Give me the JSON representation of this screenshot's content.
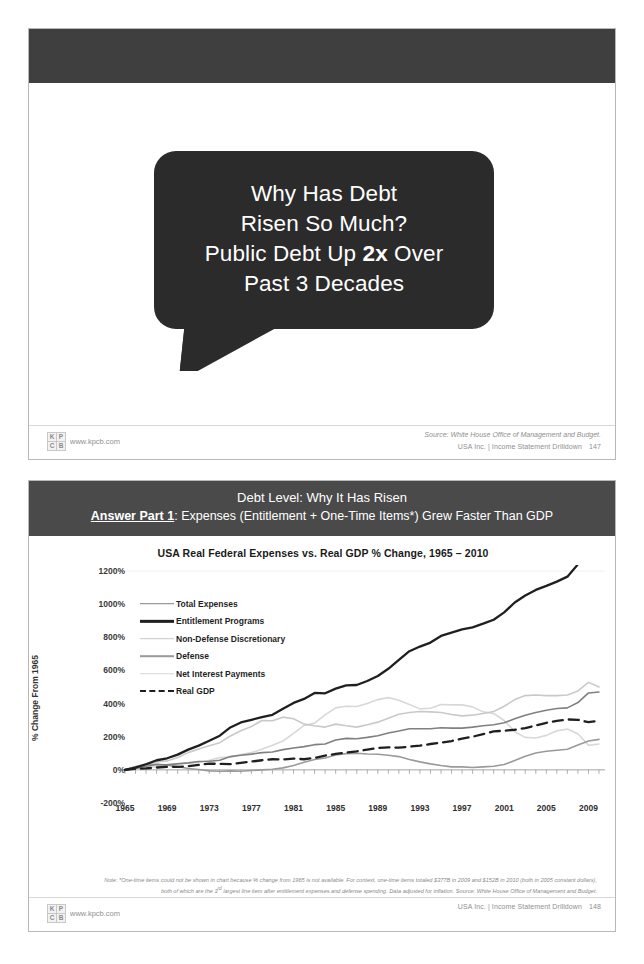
{
  "slide1": {
    "bubble_lines": [
      {
        "text": "Why Has Debt",
        "bold_part": ""
      },
      {
        "text": "Risen So Much?",
        "bold_part": ""
      },
      {
        "text": "Public Debt Up 2x Over",
        "bold_part": "2x"
      },
      {
        "text": "Past 3 Decades",
        "bold_part": ""
      }
    ],
    "footer": {
      "url": "www.kpcb.com",
      "source": "Source: White House Office of Management and Budget.",
      "deck": "USA Inc. | Income Statement Drilldown",
      "page": "147",
      "logo": [
        "K",
        "P",
        "C",
        "B"
      ]
    }
  },
  "slide2": {
    "header_line1": "Debt Level: Why It Has Risen",
    "header_line2_bold": "Answer Part 1",
    "header_line2_rest": ": Expenses (Entitlement + One-Time Items*) Grew Faster Than GDP",
    "footnote": "Note: *One-time items could not be shown in chart because % change from 1965 is not available. For context, one-time items totaled $377B in 2009 and $152B in 2010 (both in 2005 constant dollars), both of which are the 3rd largest line item after entitlement expenses and defense spending. Data adjusted for inflation. Source: White House Office of Management and Budget.",
    "footer": {
      "url": "www.kpcb.com",
      "deck": "USA Inc. | Income Statement Drilldown",
      "page": "148",
      "logo": [
        "K",
        "P",
        "C",
        "B"
      ]
    }
  },
  "chart_data": {
    "type": "line",
    "title": "USA Real Federal Expenses vs. Real GDP % Change, 1965 – 2010",
    "xlabel": "",
    "ylabel": "% Change From 1965",
    "ylim": [
      -200,
      1200
    ],
    "yticks": [
      "1200%",
      "1000%",
      "800%",
      "600%",
      "400%",
      "200%",
      "0%",
      "-200%"
    ],
    "ytick_values": [
      1200,
      1000,
      800,
      600,
      400,
      200,
      0,
      -200
    ],
    "xlim": [
      1965,
      2010
    ],
    "xticks": [
      "1965",
      "1969",
      "1973",
      "1977",
      "1981",
      "1985",
      "1989",
      "1993",
      "1997",
      "2001",
      "2005",
      "2009"
    ],
    "xtick_values": [
      1965,
      1969,
      1973,
      1977,
      1981,
      1985,
      1989,
      1993,
      1997,
      2001,
      2005,
      2009
    ],
    "grid": false,
    "legend_position": "inside-upper-left",
    "x": [
      1965,
      1966,
      1967,
      1968,
      1969,
      1970,
      1971,
      1972,
      1973,
      1974,
      1975,
      1976,
      1977,
      1978,
      1979,
      1980,
      1981,
      1982,
      1983,
      1984,
      1985,
      1986,
      1987,
      1988,
      1989,
      1990,
      1991,
      1992,
      1993,
      1994,
      1995,
      1996,
      1997,
      1998,
      1999,
      2000,
      2001,
      2002,
      2003,
      2004,
      2005,
      2006,
      2007,
      2008,
      2009,
      2010
    ],
    "series": [
      {
        "name": "Total Expenses",
        "color": "#808080",
        "width": 1.6,
        "dash": "none",
        "values": [
          0,
          8,
          22,
          32,
          30,
          36,
          42,
          50,
          52,
          58,
          80,
          88,
          95,
          104,
          108,
          122,
          132,
          140,
          152,
          156,
          180,
          190,
          188,
          196,
          206,
          222,
          234,
          248,
          248,
          248,
          254,
          252,
          252,
          258,
          266,
          272,
          284,
          308,
          330,
          346,
          360,
          370,
          374,
          406,
          464,
          470
        ]
      },
      {
        "name": "Entitlement Programs",
        "color": "#1f1f1f",
        "width": 2.3,
        "dash": "none",
        "values": [
          0,
          14,
          34,
          58,
          70,
          92,
          122,
          146,
          176,
          206,
          256,
          286,
          302,
          318,
          332,
          368,
          404,
          428,
          464,
          462,
          490,
          510,
          512,
          536,
          566,
          610,
          664,
          716,
          744,
          768,
          808,
          828,
          848,
          860,
          882,
          906,
          950,
          1010,
          1052,
          1086,
          1110,
          1136,
          1166,
          1240,
          1372,
          1398
        ]
      },
      {
        "name": "Non-Defense Discretionary",
        "color": "#c9c9c9",
        "width": 1.6,
        "dash": "none",
        "values": [
          0,
          18,
          36,
          48,
          54,
          74,
          104,
          126,
          146,
          164,
          204,
          236,
          262,
          298,
          296,
          318,
          308,
          276,
          266,
          258,
          276,
          266,
          258,
          272,
          288,
          312,
          336,
          346,
          352,
          350,
          346,
          334,
          326,
          330,
          340,
          352,
          384,
          424,
          448,
          452,
          448,
          448,
          452,
          476,
          528,
          500
        ]
      },
      {
        "name": "Defense",
        "color": "#9a9a9a",
        "width": 1.6,
        "dash": "none",
        "values": [
          0,
          20,
          32,
          34,
          28,
          20,
          8,
          2,
          -6,
          -8,
          -6,
          -8,
          -4,
          0,
          4,
          12,
          26,
          46,
          62,
          72,
          90,
          98,
          100,
          96,
          94,
          88,
          80,
          62,
          48,
          36,
          26,
          18,
          18,
          14,
          18,
          22,
          32,
          56,
          82,
          102,
          112,
          118,
          124,
          150,
          174,
          184
        ]
      },
      {
        "name": "Net Interest Payments",
        "color": "#d8d8d8",
        "width": 1.6,
        "dash": "none",
        "values": [
          0,
          6,
          12,
          20,
          32,
          38,
          40,
          44,
          58,
          74,
          78,
          92,
          104,
          124,
          148,
          174,
          220,
          268,
          282,
          332,
          374,
          384,
          382,
          400,
          424,
          436,
          420,
          394,
          368,
          372,
          394,
          392,
          392,
          380,
          350,
          340,
          298,
          230,
          196,
          192,
          208,
          236,
          246,
          218,
          148,
          156
        ]
      },
      {
        "name": "Real GDP",
        "color": "#1f1f1f",
        "width": 2.3,
        "dash": "10 6",
        "values": [
          0,
          6,
          9,
          14,
          18,
          18,
          22,
          30,
          38,
          36,
          34,
          42,
          50,
          58,
          64,
          62,
          68,
          64,
          72,
          86,
          96,
          104,
          112,
          122,
          132,
          136,
          134,
          140,
          146,
          156,
          164,
          174,
          188,
          200,
          216,
          232,
          236,
          242,
          252,
          268,
          284,
          296,
          304,
          302,
          288,
          296
        ]
      }
    ]
  }
}
